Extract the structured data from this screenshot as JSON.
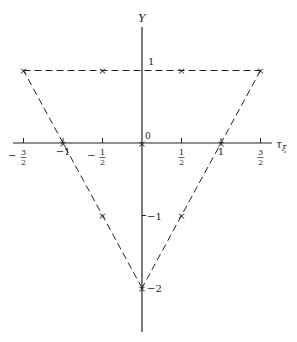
{
  "diagram": {
    "type": "weight-diagram",
    "axes": {
      "x": {
        "label": "τ",
        "label_sub": "ξ",
        "range": [
          -1.75,
          1.65
        ]
      },
      "y": {
        "label": "Y",
        "range": [
          -2.6,
          1.6
        ]
      }
    },
    "x_ticks": [
      {
        "value": -1.5,
        "num": "3",
        "den": "2",
        "sign": "−"
      },
      {
        "value": -1,
        "text": "−1"
      },
      {
        "value": -0.5,
        "num": "1",
        "den": "2",
        "sign": "−"
      },
      {
        "value": 0.5,
        "num": "1",
        "den": "2",
        "sign": ""
      },
      {
        "value": 1,
        "text": "1"
      },
      {
        "value": 1.5,
        "num": "3",
        "den": "2",
        "sign": ""
      }
    ],
    "y_ticks": [
      {
        "value": 1,
        "text": "1"
      },
      {
        "value": -1,
        "text": "−1"
      },
      {
        "value": -2,
        "text": "−2"
      }
    ],
    "origin_label": "0",
    "points": [
      {
        "x": -1.5,
        "y": 1
      },
      {
        "x": -0.5,
        "y": 1
      },
      {
        "x": 0.5,
        "y": 1
      },
      {
        "x": 1.5,
        "y": 1
      },
      {
        "x": -1,
        "y": 0
      },
      {
        "x": 0,
        "y": 0
      },
      {
        "x": 1,
        "y": 0
      },
      {
        "x": -0.5,
        "y": -1
      },
      {
        "x": 0.5,
        "y": -1
      },
      {
        "x": 0,
        "y": -2
      }
    ],
    "triangle": [
      {
        "x": -1.5,
        "y": 1
      },
      {
        "x": 1.5,
        "y": 1
      },
      {
        "x": 0,
        "y": -2
      }
    ],
    "marker": "×",
    "colors": {
      "ink": "#222222",
      "background": "#ffffff"
    }
  }
}
